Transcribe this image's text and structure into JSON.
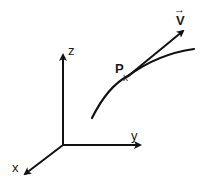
{
  "diagram": {
    "axes": {
      "z_label": "z",
      "y_label": "y",
      "x_label": "x"
    },
    "point": {
      "label": "P",
      "marker": "x"
    },
    "vector": {
      "label": "V",
      "overarrow": "→"
    },
    "colors": {
      "ink": "#111111",
      "background": "#ffffff"
    }
  }
}
